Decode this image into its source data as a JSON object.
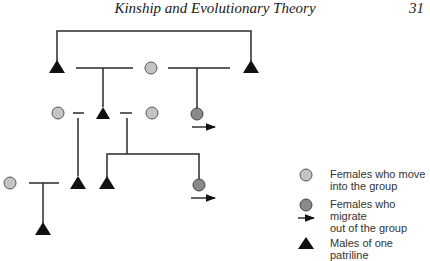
{
  "header": {
    "title": "Kinship and Evolutionary Theory",
    "page_number": "31"
  },
  "colors": {
    "line": "#2a2a2a",
    "male": "#111111",
    "female_in": "#c4c4c4",
    "female_out": "#8a8a8a",
    "outline": "#555555"
  },
  "legend": {
    "items": [
      {
        "icon": "light-circle-icon",
        "label_line1": "Females who move",
        "label_line2": "into the group"
      },
      {
        "icon": "dark-circle-arrow-icon",
        "label_line1": "Females who migrate",
        "label_line2": "out of the group"
      },
      {
        "icon": "triangle-icon",
        "label_line1": "Males of one patriline",
        "label_line2": ""
      }
    ]
  },
  "diagram": {
    "males": 7,
    "immigrant_females": 4,
    "emigrant_females": 2
  }
}
